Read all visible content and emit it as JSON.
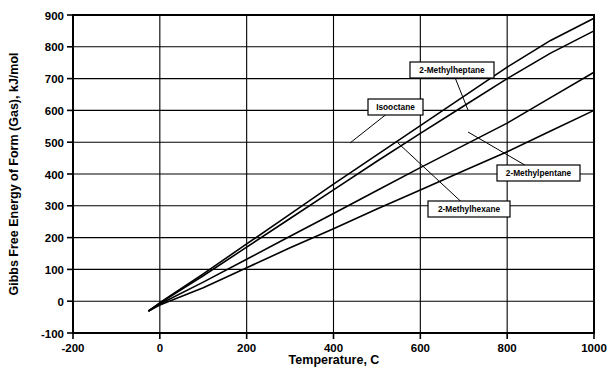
{
  "chart_data": {
    "type": "line",
    "title": "",
    "xlabel": "Temperature, C",
    "ylabel": "Gibbs Free Energy of Form (Gas), kJ/mol",
    "xlim": [
      -200,
      1000
    ],
    "ylim": [
      -100,
      900
    ],
    "xticks": [
      -200,
      0,
      200,
      400,
      600,
      800,
      1000
    ],
    "yticks": [
      -100,
      0,
      100,
      200,
      300,
      400,
      500,
      600,
      700,
      800,
      900
    ],
    "grid": true,
    "legend": "inline-callout-boxes",
    "line_color": "#000000",
    "x": [
      -25,
      0,
      100,
      200,
      300,
      400,
      500,
      600,
      700,
      800,
      900,
      1000
    ],
    "series": [
      {
        "name": "2-Methylheptane",
        "values": [
          -30,
          -5,
          86,
          180,
          274,
          368,
          460,
          552,
          644,
          736,
          820,
          890
        ]
      },
      {
        "name": "Isooctane",
        "values": [
          -30,
          -6,
          80,
          170,
          260,
          350,
          440,
          528,
          614,
          700,
          780,
          850
        ]
      },
      {
        "name": "2-Methylhexane",
        "values": [
          -30,
          -9,
          60,
          132,
          204,
          276,
          348,
          420,
          490,
          560,
          640,
          720
        ]
      },
      {
        "name": "2-Methylpentane",
        "values": [
          -30,
          -12,
          42,
          105,
          168,
          228,
          290,
          350,
          410,
          470,
          535,
          600
        ]
      }
    ],
    "annotations": [
      {
        "label": "2-Methylheptane",
        "box_x": 410,
        "box_y": 62,
        "box_w": 84,
        "box_h": 16,
        "leader_to_x": 468,
        "leader_to_y": 110
      },
      {
        "label": "Isooctane",
        "box_x": 368,
        "box_y": 99,
        "box_w": 55,
        "box_h": 16,
        "leader_to_x": 350,
        "leader_to_y": 143
      },
      {
        "label": "2-Methylpentane",
        "box_x": 497,
        "box_y": 165,
        "box_w": 83,
        "box_h": 16,
        "leader_to_x": 468,
        "leader_to_y": 132
      },
      {
        "label": "2-Methylhexane",
        "box_x": 428,
        "box_y": 201,
        "box_w": 82,
        "box_h": 16,
        "leader_to_x": 398,
        "leader_to_y": 143
      }
    ]
  }
}
